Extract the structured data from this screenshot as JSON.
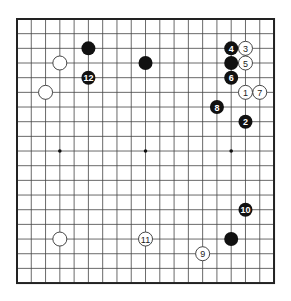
{
  "board": {
    "size": 19,
    "origin_x": 17,
    "origin_y": 19,
    "spacing_x": 14.28,
    "spacing_y": 14.67,
    "star_points": [
      [
        3,
        9
      ],
      [
        9,
        9
      ],
      [
        15,
        9
      ]
    ],
    "colors": {
      "black": "#111111",
      "white": "#ffffff",
      "line": "#444444"
    }
  },
  "stones": [
    {
      "color": "black",
      "col": 5,
      "row": 2,
      "label": ""
    },
    {
      "color": "black",
      "col": 9,
      "row": 3,
      "label": ""
    },
    {
      "color": "white",
      "col": 3,
      "row": 3,
      "label": ""
    },
    {
      "color": "black",
      "col": 5,
      "row": 4,
      "label": "12"
    },
    {
      "color": "white",
      "col": 2,
      "row": 5,
      "label": ""
    },
    {
      "color": "black",
      "col": 15,
      "row": 2,
      "label": "4"
    },
    {
      "color": "white",
      "col": 16,
      "row": 2,
      "label": "3"
    },
    {
      "color": "black",
      "col": 15,
      "row": 3,
      "label": ""
    },
    {
      "color": "white",
      "col": 16,
      "row": 3,
      "label": "5"
    },
    {
      "color": "black",
      "col": 15,
      "row": 4,
      "label": "6"
    },
    {
      "color": "white",
      "col": 16,
      "row": 5,
      "label": "1"
    },
    {
      "color": "white",
      "col": 17,
      "row": 5,
      "label": "7"
    },
    {
      "color": "black",
      "col": 14,
      "row": 6,
      "label": "8"
    },
    {
      "color": "black",
      "col": 16,
      "row": 7,
      "label": "2"
    },
    {
      "color": "black",
      "col": 16,
      "row": 13,
      "label": "10"
    },
    {
      "color": "black",
      "col": 15,
      "row": 15,
      "label": ""
    },
    {
      "color": "white",
      "col": 9,
      "row": 15,
      "label": "11"
    },
    {
      "color": "white",
      "col": 3,
      "row": 15,
      "label": ""
    },
    {
      "color": "white",
      "col": 13,
      "row": 16,
      "label": "9"
    }
  ]
}
